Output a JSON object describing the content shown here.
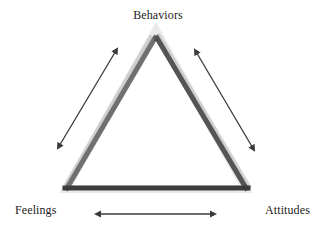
{
  "diagram": {
    "nodes": {
      "top": {
        "label": "Behaviors"
      },
      "bottom_left": {
        "label": "Feelings"
      },
      "bottom_right": {
        "label": "Attitudes"
      }
    },
    "edges": [
      {
        "from": "Behaviors",
        "to": "Feelings",
        "type": "bidirectional-arrow"
      },
      {
        "from": "Behaviors",
        "to": "Attitudes",
        "type": "bidirectional-arrow"
      },
      {
        "from": "Feelings",
        "to": "Attitudes",
        "type": "bidirectional-arrow"
      }
    ],
    "colors": {
      "triangle_stroke": "#444444",
      "triangle_shadow": "#b5b5b5",
      "arrow": "#3a3a3a",
      "text": "#1a1a1a",
      "background": "#ffffff"
    }
  }
}
